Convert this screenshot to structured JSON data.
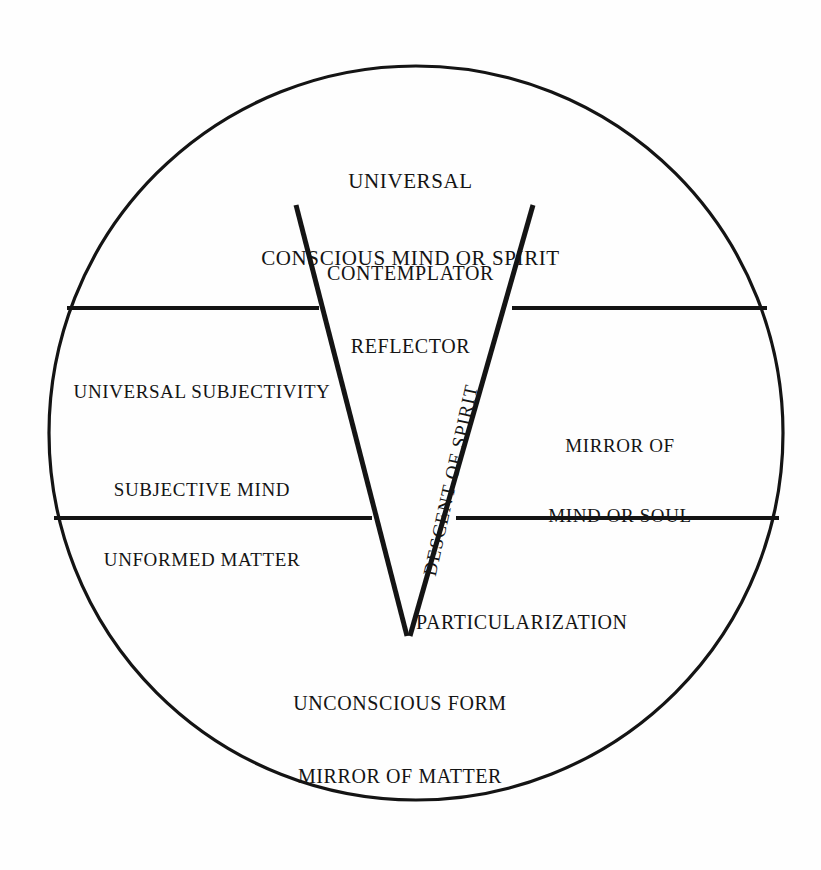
{
  "diagram": {
    "shape": "circle divided into three horizontal bands with an inverted triangle (V) overlay",
    "stroke_color": "#141414",
    "background_color": "#fefefe",
    "labels": {
      "top_band_primary_line1": "UNIVERSAL",
      "top_band_primary_line2": "CONSCIOUS MIND OR SPIRIT",
      "top_band_secondary_line1": "CONTEMPLATOR",
      "top_band_secondary_line2": "REFLECTOR",
      "left_band_primary": "UNIVERSAL SUBJECTIVITY",
      "left_band_secondary_line1": "SUBJECTIVE MIND",
      "left_band_secondary_line2": "UNFORMED MATTER",
      "right_band_line1": "MIRROR OF",
      "right_band_line2": "MIND OR SOUL",
      "apex_label": "PARTICULARIZATION",
      "bottom_band_line1": "UNCONSCIOUS FORM",
      "bottom_band_line2": "MIRROR OF MATTER",
      "axis_label": "DESCENT OF SPIRIT"
    },
    "geometry": {
      "circle_center_x": 416,
      "circle_center_y": 433,
      "circle_radius": 367,
      "upper_divider_y": 308,
      "lower_divider_y": 518,
      "v_left_top_x": 296,
      "v_right_top_x": 533,
      "v_top_y": 205,
      "v_apex_x": 407,
      "v_apex_y": 634
    }
  }
}
